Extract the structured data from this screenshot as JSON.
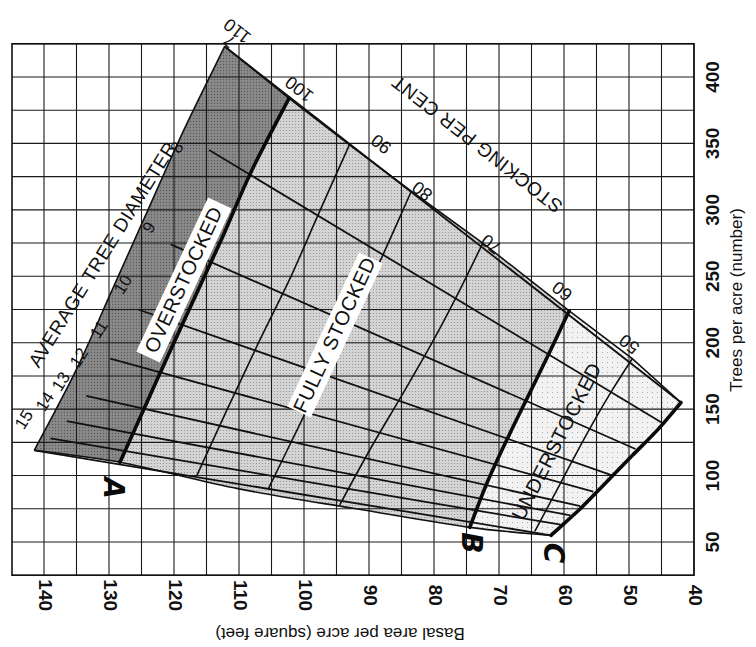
{
  "chart_data": {
    "type": "line",
    "title": "",
    "orientation_note": "Printed figure rotated 90 degrees: basal area runs along the bottom (decreasing to the right), trees per acre along the right side",
    "xlabel": "Basal area per acre (square feet)",
    "ylabel": "Trees per acre (number)",
    "x_axis": {
      "label": "Basal area per acre (square feet)",
      "range": [
        140,
        40
      ],
      "ticks": [
        140,
        130,
        120,
        110,
        100,
        90,
        80,
        70,
        60,
        50,
        40
      ],
      "tick_labels": [
        "140",
        "130",
        "120",
        "110",
        "100",
        "90",
        "80",
        "70",
        "60",
        "50",
        "40"
      ],
      "minor_step": 5
    },
    "y_axis": {
      "label": "Trees per acre (number)",
      "range": [
        25,
        425
      ],
      "ticks": [
        50,
        100,
        150,
        200,
        250,
        300,
        350,
        400
      ],
      "tick_labels": [
        "50",
        "100",
        "150",
        "200",
        "250",
        "300",
        "350",
        "400"
      ],
      "minor_step": 25
    },
    "grid": true,
    "stocking_title": "STOCKING PER CENT",
    "diameter_title": "AVERAGE TREE DIAMETER",
    "regions": [
      {
        "name": "OVERSTOCKED",
        "label": "OVERSTOCKED",
        "shade": "dark",
        "color": "#7d7d7d"
      },
      {
        "name": "FULLY STOCKED",
        "label": "FULLY STOCKED",
        "shade": "medium",
        "color": "#c9c9c9"
      },
      {
        "name": "UNDERSTOCKED",
        "label": "UNDERSTOCKED",
        "shade": "light",
        "color": "#ececec"
      }
    ],
    "curve_letters": [
      {
        "letter": "A",
        "stocking": 100
      },
      {
        "letter": "B",
        "stocking": 60
      },
      {
        "letter": "C",
        "stocking": 38
      }
    ],
    "stocking_series": [
      {
        "name": "110",
        "label": "110",
        "style": "light",
        "points": [
          [
            423,
            112.2
          ],
          [
            360,
            118.5
          ],
          [
            300,
            124
          ],
          [
            240,
            129.5
          ],
          [
            180,
            135
          ],
          [
            119,
            141.5
          ]
        ]
      },
      {
        "name": "100 (A)",
        "label": "100",
        "style": "heavy",
        "points": [
          [
            384,
            102.3
          ],
          [
            330,
            108
          ],
          [
            280,
            112.5
          ],
          [
            230,
            117.2
          ],
          [
            170,
            122.8
          ],
          [
            110,
            128.3
          ]
        ]
      },
      {
        "name": "90",
        "label": "90",
        "style": "light",
        "points": [
          [
            349,
            93
          ],
          [
            300,
            97.5
          ],
          [
            250,
            102
          ],
          [
            200,
            107
          ],
          [
            150,
            111.8
          ],
          [
            100,
            116.5
          ]
        ]
      },
      {
        "name": "80",
        "label": "80",
        "style": "light",
        "points": [
          [
            314,
            83.5
          ],
          [
            270,
            87.5
          ],
          [
            225,
            91.8
          ],
          [
            180,
            96.5
          ],
          [
            130,
            101.5
          ],
          [
            90,
            105.5
          ]
        ]
      },
      {
        "name": "70",
        "label": "70",
        "style": "light",
        "points": [
          [
            275,
            72.5
          ],
          [
            240,
            76
          ],
          [
            200,
            80.3
          ],
          [
            160,
            85
          ],
          [
            120,
            89.8
          ],
          [
            78,
            94.5
          ]
        ]
      },
      {
        "name": "60 (B)",
        "label": "60",
        "style": "heavy",
        "points": [
          [
            224,
            59.2
          ],
          [
            190,
            62.5
          ],
          [
            160,
            65.5
          ],
          [
            130,
            68.5
          ],
          [
            95,
            71.8
          ],
          [
            61,
            74.5
          ]
        ]
      },
      {
        "name": "50",
        "label": "50",
        "style": "light",
        "points": [
          [
            188,
            49.5
          ],
          [
            165,
            52.5
          ],
          [
            140,
            55.5
          ],
          [
            115,
            58.3
          ],
          [
            90,
            61
          ],
          [
            58,
            64.5
          ]
        ]
      },
      {
        "name": "C",
        "label": "",
        "style": "heavy",
        "points": [
          [
            155,
            42
          ],
          [
            135,
            45.5
          ],
          [
            115,
            49.5
          ],
          [
            95,
            53.5
          ],
          [
            75,
            57.5
          ],
          [
            55,
            62
          ]
        ]
      }
    ],
    "diameter_series": [
      {
        "diameter": 7,
        "label": "7",
        "points": [
          [
            423,
            112.2
          ],
          [
            155,
            42
          ]
        ]
      },
      {
        "diameter": 8,
        "label": "8",
        "points": [
          [
            345,
            114.6
          ],
          [
            140,
            45
          ]
        ]
      },
      {
        "diameter": 9,
        "label": "9",
        "points": [
          [
            274,
            120.5
          ],
          [
            120,
            49
          ]
        ]
      },
      {
        "diameter": 10,
        "label": "10",
        "points": [
          [
            225,
            125.5
          ],
          [
            100,
            52.5
          ]
        ]
      },
      {
        "diameter": 11,
        "label": "11",
        "points": [
          [
            188,
            129.8
          ],
          [
            88,
            55.5
          ]
        ]
      },
      {
        "diameter": 12,
        "label": "12",
        "points": [
          [
            160,
            133.5
          ],
          [
            77,
            57.5
          ]
        ]
      },
      {
        "diameter": 13,
        "label": "13",
        "points": [
          [
            141,
            136.5
          ],
          [
            70,
            59
          ]
        ]
      },
      {
        "diameter": 14,
        "label": "14",
        "points": [
          [
            128,
            139
          ],
          [
            63,
            60.5
          ]
        ]
      },
      {
        "diameter": 15,
        "label": "15",
        "points": [
          [
            119,
            141.5
          ],
          [
            55,
            62
          ]
        ]
      }
    ],
    "lower_boundary": [
      [
        119,
        141.5
      ],
      [
        110,
        128.3
      ],
      [
        90,
        110
      ],
      [
        75,
        92
      ],
      [
        61,
        74.5
      ],
      [
        55,
        62
      ]
    ],
    "upper_boundary": [
      [
        423,
        112.2
      ],
      [
        384,
        102.3
      ],
      [
        349,
        93
      ],
      [
        314,
        83.5
      ],
      [
        275,
        72.5
      ],
      [
        224,
        59.2
      ],
      [
        188,
        49.5
      ],
      [
        155,
        42
      ]
    ]
  }
}
